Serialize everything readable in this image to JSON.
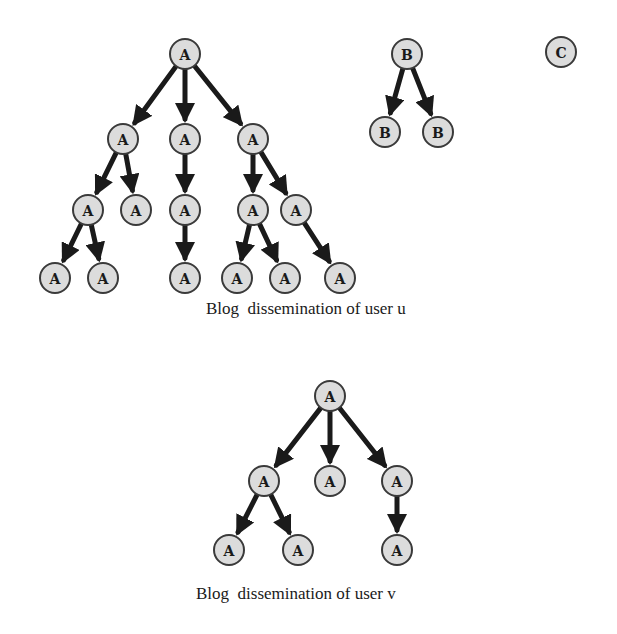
{
  "diagram": {
    "type": "tree-forest",
    "colors": {
      "node_fill": "#dcdcdc",
      "node_stroke": "#3a3a3a",
      "edge": "#1a1a1a",
      "text": "#1a1a1a"
    },
    "node_radius": 15,
    "captions": {
      "user_u": "Blog  dissemination of user u",
      "user_v": "Blog  dissemination of user v"
    },
    "nodes": [
      {
        "id": "u0",
        "label": "A",
        "x": 185,
        "y": 54
      },
      {
        "id": "u1",
        "label": "A",
        "x": 123,
        "y": 139
      },
      {
        "id": "u2",
        "label": "A",
        "x": 185,
        "y": 139
      },
      {
        "id": "u3",
        "label": "A",
        "x": 253,
        "y": 139
      },
      {
        "id": "u4",
        "label": "A",
        "x": 88,
        "y": 210
      },
      {
        "id": "u5",
        "label": "A",
        "x": 136,
        "y": 210
      },
      {
        "id": "u6",
        "label": "A",
        "x": 185,
        "y": 210
      },
      {
        "id": "u7",
        "label": "A",
        "x": 253,
        "y": 210
      },
      {
        "id": "u8",
        "label": "A",
        "x": 296,
        "y": 210
      },
      {
        "id": "u9",
        "label": "A",
        "x": 55,
        "y": 278
      },
      {
        "id": "u10",
        "label": "A",
        "x": 103,
        "y": 278
      },
      {
        "id": "u11",
        "label": "A",
        "x": 185,
        "y": 278
      },
      {
        "id": "u12",
        "label": "A",
        "x": 237,
        "y": 278
      },
      {
        "id": "u13",
        "label": "A",
        "x": 285,
        "y": 278
      },
      {
        "id": "u14",
        "label": "A",
        "x": 340,
        "y": 278
      },
      {
        "id": "b0",
        "label": "B",
        "x": 407,
        "y": 54
      },
      {
        "id": "b1",
        "label": "B",
        "x": 385,
        "y": 132
      },
      {
        "id": "b2",
        "label": "B",
        "x": 438,
        "y": 132
      },
      {
        "id": "c0",
        "label": "C",
        "x": 561,
        "y": 52
      },
      {
        "id": "v0",
        "label": "A",
        "x": 330,
        "y": 396
      },
      {
        "id": "v1",
        "label": "A",
        "x": 264,
        "y": 481
      },
      {
        "id": "v2",
        "label": "A",
        "x": 330,
        "y": 481
      },
      {
        "id": "v3",
        "label": "A",
        "x": 397,
        "y": 481
      },
      {
        "id": "v4",
        "label": "A",
        "x": 229,
        "y": 550
      },
      {
        "id": "v5",
        "label": "A",
        "x": 298,
        "y": 550
      },
      {
        "id": "v6",
        "label": "A",
        "x": 397,
        "y": 550
      }
    ],
    "edges": [
      [
        "u0",
        "u1"
      ],
      [
        "u0",
        "u2"
      ],
      [
        "u0",
        "u3"
      ],
      [
        "u1",
        "u4"
      ],
      [
        "u1",
        "u5"
      ],
      [
        "u2",
        "u6"
      ],
      [
        "u3",
        "u7"
      ],
      [
        "u3",
        "u8"
      ],
      [
        "u4",
        "u9"
      ],
      [
        "u4",
        "u10"
      ],
      [
        "u6",
        "u11"
      ],
      [
        "u7",
        "u12"
      ],
      [
        "u7",
        "u13"
      ],
      [
        "u8",
        "u14"
      ],
      [
        "b0",
        "b1"
      ],
      [
        "b0",
        "b2"
      ],
      [
        "v0",
        "v1"
      ],
      [
        "v0",
        "v2"
      ],
      [
        "v0",
        "v3"
      ],
      [
        "v1",
        "v4"
      ],
      [
        "v1",
        "v5"
      ],
      [
        "v3",
        "v6"
      ]
    ]
  }
}
